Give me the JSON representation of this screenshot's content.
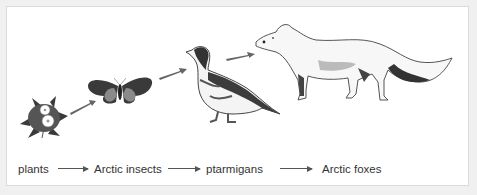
{
  "diagram": {
    "type": "food-chain",
    "organisms": [
      {
        "name": "plants",
        "icon": "flower-icon"
      },
      {
        "name": "Arctic insects",
        "icon": "butterfly-icon"
      },
      {
        "name": "ptarmigans",
        "icon": "ptarmigan-icon"
      },
      {
        "name": "Arctic foxes",
        "icon": "arctic-fox-icon"
      }
    ],
    "labels": {
      "l0": "plants",
      "l1": "Arctic insects",
      "l2": "ptarmigans",
      "l3": "Arctic foxes"
    },
    "colors": {
      "ink": "#333333",
      "arrow": "#555555",
      "background": "#ffffff",
      "frame": "#dcdcdc"
    }
  }
}
